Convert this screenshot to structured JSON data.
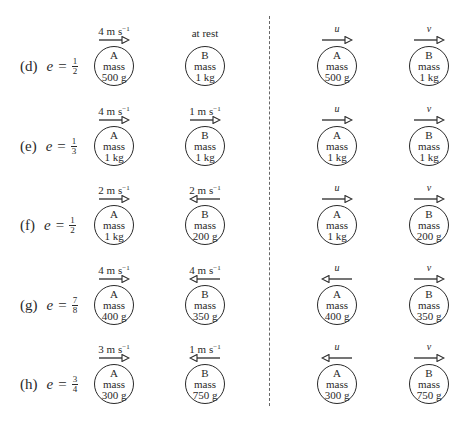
{
  "diagram": {
    "divider": "dashed-vertical-line",
    "colors": {
      "ink": "#2a2a2a",
      "divider": "#666666"
    },
    "rows": [
      {
        "letter": "(d)",
        "e_symbol": "e",
        "eq": "=",
        "e_num": "1",
        "e_den": "2",
        "before": {
          "A": {
            "name": "A",
            "mass_label": "mass",
            "mass": "500 g",
            "velocity": "4 m s",
            "velocity_exp": "−1",
            "direction": "right"
          },
          "B": {
            "name": "B",
            "mass_label": "mass",
            "mass": "1 kg",
            "velocity": "at rest",
            "velocity_exp": "",
            "direction": "none"
          }
        },
        "after": {
          "A": {
            "name": "A",
            "mass_label": "mass",
            "mass": "500 g",
            "velocity": "u",
            "direction": "right"
          },
          "B": {
            "name": "B",
            "mass_label": "mass",
            "mass": "1 kg",
            "velocity": "v",
            "direction": "right"
          }
        }
      },
      {
        "letter": "(e)",
        "e_symbol": "e",
        "eq": "=",
        "e_num": "1",
        "e_den": "3",
        "before": {
          "A": {
            "name": "A",
            "mass_label": "mass",
            "mass": "1 kg",
            "velocity": "4 m s",
            "velocity_exp": "−1",
            "direction": "right"
          },
          "B": {
            "name": "B",
            "mass_label": "mass",
            "mass": "1 kg",
            "velocity": "1 m s",
            "velocity_exp": "−1",
            "direction": "right"
          }
        },
        "after": {
          "A": {
            "name": "A",
            "mass_label": "mass",
            "mass": "1 kg",
            "velocity": "u",
            "direction": "right"
          },
          "B": {
            "name": "B",
            "mass_label": "mass",
            "mass": "1 kg",
            "velocity": "v",
            "direction": "right"
          }
        }
      },
      {
        "letter": "(f)",
        "e_symbol": "e",
        "eq": "=",
        "e_num": "1",
        "e_den": "2",
        "before": {
          "A": {
            "name": "A",
            "mass_label": "mass",
            "mass": "1 kg",
            "velocity": "2 m s",
            "velocity_exp": "−1",
            "direction": "right"
          },
          "B": {
            "name": "B",
            "mass_label": "mass",
            "mass": "200 g",
            "velocity": "2 m s",
            "velocity_exp": "−1",
            "direction": "left"
          }
        },
        "after": {
          "A": {
            "name": "A",
            "mass_label": "mass",
            "mass": "1 kg",
            "velocity": "u",
            "direction": "right"
          },
          "B": {
            "name": "B",
            "mass_label": "mass",
            "mass": "200 g",
            "velocity": "v",
            "direction": "right"
          }
        }
      },
      {
        "letter": "(g)",
        "e_symbol": "e",
        "eq": "=",
        "e_num": "7",
        "e_den": "8",
        "before": {
          "A": {
            "name": "A",
            "mass_label": "mass",
            "mass": "400 g",
            "velocity": "4 m s",
            "velocity_exp": "−1",
            "direction": "right"
          },
          "B": {
            "name": "B",
            "mass_label": "mass",
            "mass": "350 g",
            "velocity": "4 m s",
            "velocity_exp": "−1",
            "direction": "left"
          }
        },
        "after": {
          "A": {
            "name": "A",
            "mass_label": "mass",
            "mass": "400 g",
            "velocity": "u",
            "direction": "left"
          },
          "B": {
            "name": "B",
            "mass_label": "mass",
            "mass": "350 g",
            "velocity": "v",
            "direction": "right"
          }
        }
      },
      {
        "letter": "(h)",
        "e_symbol": "e",
        "eq": "=",
        "e_num": "3",
        "e_den": "4",
        "before": {
          "A": {
            "name": "A",
            "mass_label": "mass",
            "mass": "300 g",
            "velocity": "3 m s",
            "velocity_exp": "−1",
            "direction": "right"
          },
          "B": {
            "name": "B",
            "mass_label": "mass",
            "mass": "750 g",
            "velocity": "1 m s",
            "velocity_exp": "−1",
            "direction": "left"
          }
        },
        "after": {
          "A": {
            "name": "A",
            "mass_label": "mass",
            "mass": "300 g",
            "velocity": "u",
            "direction": "left"
          },
          "B": {
            "name": "B",
            "mass_label": "mass",
            "mass": "750 g",
            "velocity": "v",
            "direction": "right"
          }
        }
      }
    ]
  }
}
